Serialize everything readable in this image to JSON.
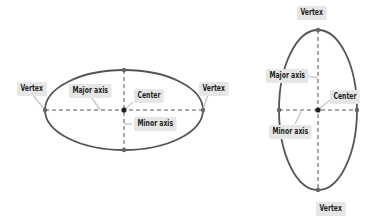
{
  "figures": [
    {
      "name": "horizontal-ellipse",
      "labels": {
        "vertex_left": "Vertex",
        "vertex_right": "Vertex",
        "major_axis": "Major axis",
        "center": "Center",
        "minor_axis": "Minor axis"
      }
    },
    {
      "name": "vertical-ellipse",
      "labels": {
        "vertex_top": "Vertex",
        "vertex_bottom": "Vertex",
        "major_axis": "Major axis",
        "center": "Center",
        "minor_axis": "Minor axis"
      }
    }
  ],
  "colors": {
    "ellipse_stroke": "#555555",
    "axis_dash": "#555555",
    "point": "#666666",
    "center_point": "#222222",
    "label_bg": "#e6e6e6",
    "label_text": "#1e1e1e"
  }
}
